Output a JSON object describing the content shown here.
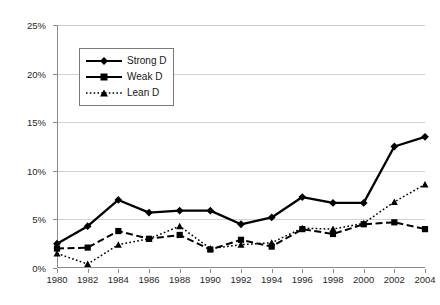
{
  "chart_data": {
    "type": "line",
    "title": "",
    "subtitle": "",
    "xlabel": "",
    "ylabel": "",
    "x": [
      1980,
      1982,
      1984,
      1986,
      1988,
      1990,
      1992,
      1994,
      1996,
      1998,
      2000,
      2002,
      2004
    ],
    "categories": [
      "1980",
      "1982",
      "1984",
      "1986",
      "1988",
      "1990",
      "1992",
      "1994",
      "1996",
      "1998",
      "2000",
      "2002",
      "2004"
    ],
    "xlim": [
      1980,
      2004
    ],
    "ylim": [
      0,
      25
    ],
    "ytick_labels": [
      "0%",
      "5%",
      "10%",
      "15%",
      "20%",
      "25%"
    ],
    "ytick_values": [
      0,
      5,
      10,
      15,
      20,
      25
    ],
    "grid": "horizontal",
    "legend_position": "upper-left-inside",
    "series": [
      {
        "name": "Strong D",
        "marker": "diamond",
        "linestyle": "solid",
        "color": "#000000",
        "values": [
          2.5,
          4.3,
          7.0,
          5.7,
          5.9,
          5.9,
          4.5,
          5.2,
          7.3,
          6.7,
          6.7,
          12.5,
          13.5
        ]
      },
      {
        "name": "Weak D",
        "marker": "square",
        "linestyle": "dashed",
        "color": "#000000",
        "values": [
          2.0,
          2.1,
          3.8,
          3.0,
          3.4,
          1.9,
          2.9,
          2.2,
          4.0,
          3.5,
          4.5,
          4.7,
          4.0
        ]
      },
      {
        "name": "Lean D",
        "marker": "triangle",
        "linestyle": "dotted",
        "color": "#000000",
        "values": [
          1.5,
          0.4,
          2.4,
          3.0,
          4.3,
          2.0,
          2.4,
          2.6,
          4.1,
          4.0,
          4.6,
          6.8,
          8.6
        ]
      }
    ]
  },
  "legend": {
    "items": [
      {
        "label": "Strong D",
        "icon": "diamond-marker-solid-line"
      },
      {
        "label": "Weak D",
        "icon": "square-marker-dashed-line"
      },
      {
        "label": "Lean D",
        "icon": "triangle-marker-dotted-line"
      }
    ]
  },
  "colors": {
    "axis": "#8a8a8a",
    "gridline": "#d2d2d2",
    "series": "#000000",
    "text": "#272727",
    "background": "#ffffff"
  }
}
